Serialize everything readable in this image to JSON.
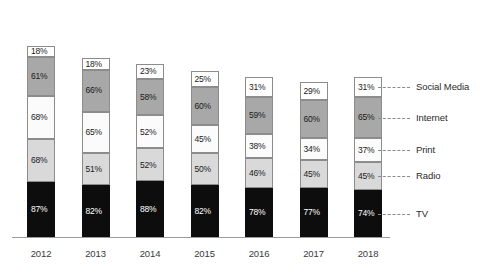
{
  "chart_data": {
    "type": "bar",
    "subtype": "stacked-bar",
    "title": "",
    "subtitle": "",
    "xlabel": "",
    "ylabel": "",
    "grid": false,
    "legend_position": "right",
    "note": "Each segment is labelled with its own percentage value; segments are stacked but do not sum to 100%.",
    "categories": [
      "2012",
      "2013",
      "2014",
      "2015",
      "2016",
      "2017",
      "2018"
    ],
    "series": [
      {
        "name": "TV",
        "color": "#0d0d0d",
        "values": [
          87,
          82,
          88,
          82,
          78,
          77,
          74
        ]
      },
      {
        "name": "Radio",
        "color": "#d9d9d9",
        "values": [
          68,
          51,
          52,
          50,
          46,
          45,
          45
        ]
      },
      {
        "name": "Print",
        "color": "#fbfbfb",
        "values": [
          68,
          65,
          52,
          45,
          38,
          34,
          37
        ]
      },
      {
        "name": "Internet",
        "color": "#a8a8a8",
        "values": [
          61,
          66,
          58,
          60,
          59,
          60,
          65
        ]
      },
      {
        "name": "Social Media",
        "color": "#ffffff",
        "values": [
          18,
          18,
          23,
          25,
          31,
          29,
          31
        ]
      }
    ],
    "value_labels": {
      "2012": {
        "TV": "87%",
        "Radio": "68%",
        "Print": "68%",
        "Internet": "61%",
        "Social Media": "18%"
      },
      "2013": {
        "TV": "82%",
        "Radio": "51%",
        "Print": "65%",
        "Internet": "66%",
        "Social Media": "18%"
      },
      "2014": {
        "TV": "88%",
        "Radio": "52%",
        "Print": "52%",
        "Internet": "58%",
        "Social Media": "23%"
      },
      "2015": {
        "TV": "82%",
        "Radio": "50%",
        "Print": "45%",
        "Internet": "60%",
        "Social Media": "25%"
      },
      "2016": {
        "TV": "78%",
        "Radio": "46%",
        "Print": "38%",
        "Internet": "59%",
        "Social Media": "31%"
      },
      "2017": {
        "TV": "77%",
        "Radio": "45%",
        "Print": "34%",
        "Internet": "60%",
        "Social Media": "29%"
      },
      "2018": {
        "TV": "74%",
        "Radio": "45%",
        "Print": "37%",
        "Internet": "65%",
        "Social Media": "31%"
      }
    },
    "legend_entries": [
      {
        "label": "Social Media"
      },
      {
        "label": "Internet"
      },
      {
        "label": "Print"
      },
      {
        "label": "Radio"
      },
      {
        "label": "TV"
      }
    ]
  },
  "axis": {
    "ticks": [
      "2012",
      "2013",
      "2014",
      "2015",
      "2016",
      "2017",
      "2018"
    ]
  },
  "colors": {
    "tv": "#0d0d0d",
    "radio": "#d9d9d9",
    "print": "#fbfbfb",
    "internet": "#a8a8a8",
    "social_media": "#ffffff",
    "segment_stroke": "#8c8c8c",
    "axis": "#9a9a9a",
    "leader": "#8a8a8a",
    "background": "#ffffff"
  }
}
